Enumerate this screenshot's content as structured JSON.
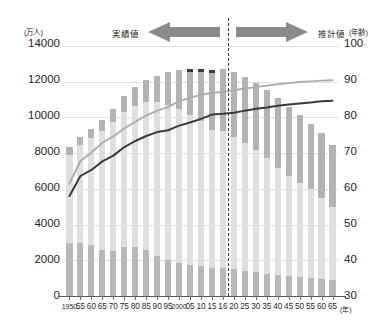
{
  "axes": {
    "left_unit": "(万人)",
    "right_unit": "(年齢)",
    "x_unit": "(年)",
    "left_ticks": [
      "14000",
      "12000",
      "10000",
      "8000",
      "6000",
      "4000",
      "2000",
      "0"
    ],
    "right_ticks": [
      "100",
      "90",
      "80",
      "70",
      "60",
      "50",
      "40",
      "30"
    ],
    "x_ticks": [
      "1950",
      "55",
      "60",
      "65",
      "70",
      "75",
      "80",
      "85",
      "90",
      "95",
      "2000",
      "05",
      "10",
      "15",
      "16",
      "20",
      "25",
      "30",
      "35",
      "40",
      "45",
      "50",
      "55",
      "60",
      "65"
    ]
  },
  "annotations": {
    "actual_label": "実績値",
    "projection_label": "推計値"
  },
  "colors": {
    "bar_elderly": "#b4b3b1",
    "bar_elderly_cap": "#3b3b3b",
    "bar_working": "#e0dfdd",
    "bar_youth": "#b9b8b6",
    "line_female": "#aeadab",
    "line_male": "#3a3a3a",
    "gridline": "#e3e1df",
    "axis": "#58595b"
  },
  "chart_data": {
    "type": "bar",
    "title": "",
    "xlabel": "(年)",
    "ylabel": "(万人)",
    "ylim": [
      0,
      14000
    ],
    "y2lim": [
      30,
      100
    ],
    "y2label": "(年齢)",
    "grid": true,
    "legend": "none",
    "divider_after_category": "16",
    "categories": [
      "1950",
      "55",
      "60",
      "65",
      "70",
      "75",
      "80",
      "85",
      "90",
      "95",
      "2000",
      "05",
      "10",
      "15",
      "16",
      "20",
      "25",
      "30",
      "35",
      "40",
      "45",
      "50",
      "55",
      "60",
      "65"
    ],
    "series": [
      {
        "name": "年少人口(0-14歳)",
        "stack": "population",
        "values": [
          2943,
          2980,
          2843,
          2553,
          2515,
          2722,
          2751,
          2603,
          2249,
          2001,
          1847,
          1752,
          1684,
          1595,
          1578,
          1508,
          1407,
          1321,
          1246,
          1194,
          1138,
          1077,
          1012,
          954,
          898
        ]
      },
      {
        "name": "生産年齢人口(15-64歳)",
        "stack": "population",
        "values": [
          4966,
          5473,
          6000,
          6693,
          7212,
          7581,
          7883,
          8251,
          8590,
          8716,
          8622,
          8409,
          8103,
          7728,
          7656,
          7406,
          7170,
          6875,
          6494,
          5978,
          5584,
          5275,
          4961,
          4529,
          4105
        ]
      },
      {
        "name": "老年人口(65歳以上)",
        "stack": "population",
        "values": [
          411,
          475,
          535,
          618,
          733,
          887,
          1065,
          1247,
          1489,
          1826,
          2201,
          2576,
          2925,
          3347,
          3459,
          3612,
          3677,
          3716,
          3782,
          3921,
          3878,
          3767,
          3677,
          3654,
          3476
        ]
      }
    ],
    "total_population": [
      8320,
      8928,
      9378,
      9864,
      10460,
      11190,
      11699,
      12101,
      12328,
      12543,
      12670,
      12737,
      12712,
      12670,
      12693,
      12526,
      12254,
      11912,
      11522,
      11093,
      10600,
      10119,
      9650,
      9137,
      8479
    ],
    "lines": [
      {
        "name": "女性平均寿命",
        "axis": "y2",
        "unit": "年齢",
        "values": [
          61.5,
          67.8,
          70.2,
          72.9,
          74.7,
          76.9,
          78.8,
          80.5,
          81.9,
          82.9,
          84.6,
          85.5,
          86.3,
          86.9,
          87.1,
          87.6,
          88.1,
          88.5,
          88.9,
          89.3,
          89.6,
          89.9,
          90.1,
          90.3,
          90.4
        ]
      },
      {
        "name": "男性平均寿命",
        "axis": "y2",
        "unit": "年齢",
        "values": [
          58.0,
          63.6,
          65.3,
          67.7,
          69.3,
          71.7,
          73.4,
          74.8,
          75.9,
          76.4,
          77.7,
          78.6,
          79.6,
          80.8,
          81.0,
          81.3,
          81.9,
          82.4,
          82.8,
          83.3,
          83.6,
          83.9,
          84.2,
          84.5,
          84.7
        ]
      }
    ]
  }
}
